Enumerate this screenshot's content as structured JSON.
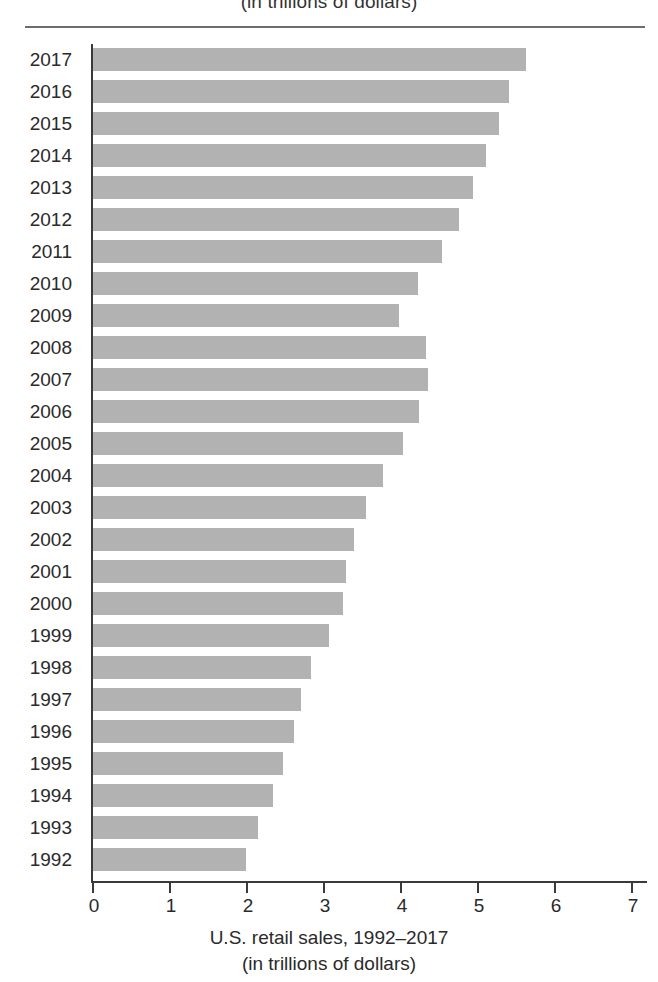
{
  "header": {
    "clipped_caption": "(in trillions of dollars)"
  },
  "axis": {
    "x_caption_line1": "U.S. retail sales, 1992–2017",
    "x_caption_line2": "(in trillions of dollars)",
    "x_ticks": [
      "0",
      "1",
      "2",
      "3",
      "4",
      "5",
      "6",
      "7"
    ]
  },
  "colors": {
    "bar": "#b2b2b2",
    "axis": "#3a3a3a",
    "rule": "#6d6d6d",
    "text": "#2a2a2a",
    "background": "#ffffff"
  },
  "chart_data": {
    "type": "bar",
    "orientation": "horizontal",
    "title": "",
    "xlabel": "U.S. retail sales, 1992–2017 (in trillions of dollars)",
    "ylabel": "",
    "xlim": [
      0,
      7
    ],
    "grid": false,
    "legend": "none",
    "xticks": [
      0,
      1,
      2,
      3,
      4,
      5,
      6,
      7
    ],
    "categories": [
      "2017",
      "2016",
      "2015",
      "2014",
      "2013",
      "2012",
      "2011",
      "2010",
      "2009",
      "2008",
      "2007",
      "2006",
      "2005",
      "2004",
      "2003",
      "2002",
      "2001",
      "2000",
      "1999",
      "1998",
      "1997",
      "1996",
      "1995",
      "1994",
      "1993",
      "1992"
    ],
    "values": [
      5.62,
      5.4,
      5.27,
      5.1,
      4.94,
      4.75,
      4.53,
      4.22,
      3.97,
      4.32,
      4.35,
      4.23,
      4.03,
      3.77,
      3.55,
      3.39,
      3.29,
      3.25,
      3.06,
      2.83,
      2.7,
      2.61,
      2.47,
      2.34,
      2.14,
      1.99
    ],
    "units": "trillions of dollars"
  }
}
